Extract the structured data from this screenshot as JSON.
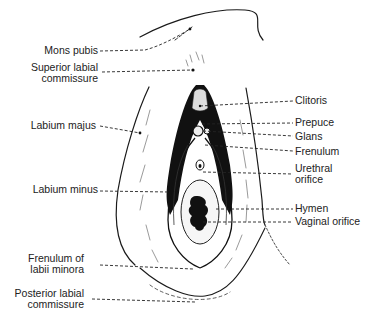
{
  "figure": {
    "labels_left": [
      {
        "id": "mons-pubis",
        "lines": [
          "Mons pubis"
        ]
      },
      {
        "id": "superior-labial-commissure",
        "lines": [
          "Superior labial",
          "commissure"
        ]
      },
      {
        "id": "labium-majus",
        "lines": [
          "Labium majus"
        ]
      },
      {
        "id": "labium-minus",
        "lines": [
          "Labium minus"
        ]
      },
      {
        "id": "frenulum-of-labii-minora",
        "lines": [
          "Frenulum of",
          "labii minora"
        ]
      },
      {
        "id": "posterior-labial-commissure",
        "lines": [
          "Posterior labial",
          "commissure"
        ]
      }
    ],
    "labels_right": [
      {
        "id": "clitoris",
        "lines": [
          "Clitoris"
        ]
      },
      {
        "id": "prepuce",
        "lines": [
          "Prepuce"
        ]
      },
      {
        "id": "glans",
        "lines": [
          "Glans"
        ]
      },
      {
        "id": "frenulum",
        "lines": [
          "Frenulum"
        ]
      },
      {
        "id": "urethral-orifice",
        "lines": [
          "Urethral",
          "orifice"
        ]
      },
      {
        "id": "hymen",
        "lines": [
          "Hymen"
        ]
      },
      {
        "id": "vaginal-orifice",
        "lines": [
          "Vaginal orifice"
        ]
      }
    ]
  }
}
